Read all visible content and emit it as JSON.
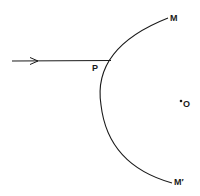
{
  "diagram": {
    "type": "optics-concave-mirror-ray",
    "labels": {
      "mirror_top": "M",
      "mirror_bottom": "M′",
      "incidence_point": "P",
      "center": "O"
    },
    "colors": {
      "stroke": "#1a1a1a",
      "background": "#ffffff"
    }
  }
}
